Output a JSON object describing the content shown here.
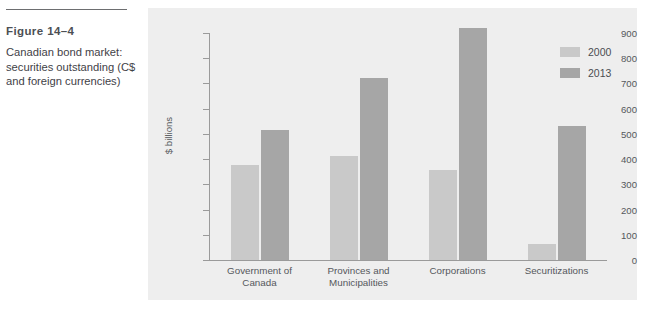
{
  "figure": {
    "number": "Figure 14–4",
    "caption": "Canadian bond market: securities outstanding (C$ and foreign currencies)"
  },
  "chart_data": {
    "type": "bar",
    "title": "Canadian bond market: securities outstanding (C$ and foreign currencies)",
    "categories": [
      "Government of Canada",
      "Provinces and Municipalities",
      "Corporations",
      "Securitizations"
    ],
    "category_lines": [
      [
        "Government of",
        "Canada"
      ],
      [
        "Provinces and",
        "Municipalities"
      ],
      [
        "Corporations"
      ],
      [
        "Securitizations"
      ]
    ],
    "series": [
      {
        "name": "2000",
        "color": "#c9c9c9",
        "values": [
          375,
          412,
          355,
          65
        ]
      },
      {
        "name": "2013",
        "color": "#a6a6a6",
        "values": [
          515,
          720,
          920,
          530
        ]
      }
    ],
    "xlabel": "",
    "ylabel": "$ billions",
    "ylim": [
      0,
      900
    ],
    "ytick_step": 100,
    "yticks": [
      0,
      100,
      200,
      300,
      400,
      500,
      600,
      700,
      800,
      900
    ],
    "grid": false,
    "legend_position": "top-right",
    "panel_background": "#eeeeee"
  }
}
